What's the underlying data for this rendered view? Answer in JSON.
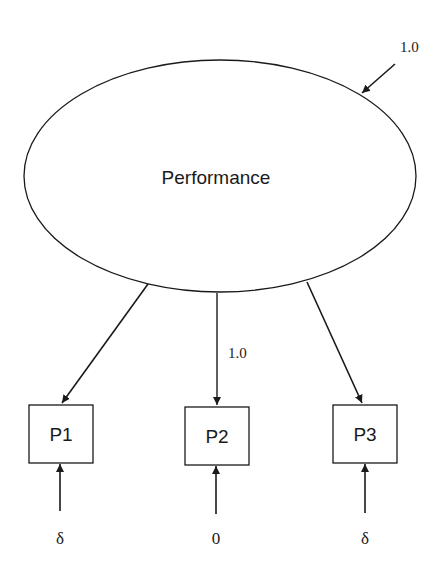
{
  "diagram": {
    "type": "measurement-model",
    "latent": {
      "label": "Performance",
      "variance_label": "1.0"
    },
    "indicators": [
      {
        "label": "P1",
        "loading_label": "",
        "error_label": "δ"
      },
      {
        "label": "P2",
        "loading_label": "1.0",
        "error_label": "0"
      },
      {
        "label": "P3",
        "loading_label": "",
        "error_label": "δ"
      }
    ],
    "colors": {
      "stroke": "#1a1a1a",
      "background": "#ffffff"
    }
  }
}
